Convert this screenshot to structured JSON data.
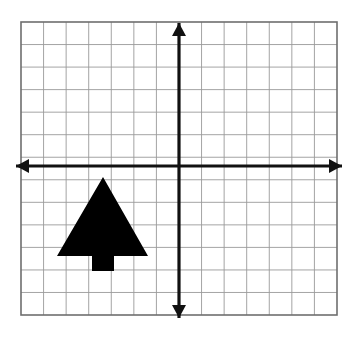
{
  "figure": {
    "background_color": "#ffffff",
    "canvas": {
      "width": 356,
      "height": 339
    }
  },
  "grid": {
    "label": "grid",
    "x_left": 21,
    "y_top": 22,
    "x_right": 337,
    "y_bottom": 315,
    "columns": 14,
    "rows": 13,
    "cell_width": 22.57,
    "cell_height": 22.54,
    "minor_line_color": "#9a9a9a",
    "border_color": "#6e6e6e",
    "minor_line_width": 0.9,
    "border_line_width": 1.6
  },
  "axes": {
    "label": "axes",
    "color": "#111111",
    "line_width": 3.2,
    "origin_x": 179,
    "origin_y": 166,
    "x_axis": {
      "name": "x-axis",
      "y": 166,
      "x_start": 16,
      "x_end": 342,
      "arrow_left": true,
      "arrow_right": true
    },
    "y_axis": {
      "name": "y-axis",
      "x": 179,
      "y_start": 23,
      "y_end": 318,
      "arrow_up": true,
      "arrow_down": true
    },
    "arrowhead": {
      "length": 13,
      "half_width": 7
    }
  },
  "shape": {
    "name": "arrow-figure",
    "description": "Upward-pointing solid black arrow (triangle head on rectangular stem) located in the third quadrant, left of the y-axis and below the x-axis",
    "fill_color": "#000000",
    "points": [
      [
        103,
        177
      ],
      [
        148,
        256
      ],
      [
        114,
        256
      ],
      [
        114,
        271
      ],
      [
        92,
        271
      ],
      [
        92,
        256
      ],
      [
        57,
        256
      ]
    ],
    "grid_points": [
      [
        -3.4,
        -0.5
      ],
      [
        -1.4,
        -4.0
      ],
      [
        -2.9,
        -4.0
      ],
      [
        -2.9,
        -4.7
      ],
      [
        -3.9,
        -4.7
      ],
      [
        -3.9,
        -4.0
      ],
      [
        -5.4,
        -4.0
      ]
    ],
    "apex": [
      103,
      177
    ],
    "base_y": 256,
    "base_left_x": 57,
    "base_right_x": 148,
    "stem_left_x": 92,
    "stem_right_x": 114,
    "stem_bottom_y": 271
  },
  "chart_data": {
    "type": "scatter",
    "title": "",
    "xlabel": "",
    "ylabel": "",
    "grid": true,
    "legend": false,
    "xlim": [
      -7,
      7
    ],
    "ylim": [
      -6.4,
      6.6
    ],
    "x_ticks": [
      -7,
      -6,
      -5,
      -4,
      -3,
      -2,
      -1,
      0,
      1,
      2,
      3,
      4,
      5,
      6,
      7
    ],
    "y_ticks": [
      -6,
      -5,
      -4,
      -3,
      -2,
      -1,
      0,
      1,
      2,
      3,
      4,
      5,
      6
    ],
    "tick_labels_shown": false,
    "series": [
      {
        "name": "arrow-figure",
        "type": "polygon",
        "fill": "#000000",
        "x": [
          -3.4,
          -1.4,
          -2.9,
          -2.9,
          -3.9,
          -3.9,
          -5.4
        ],
        "y": [
          -0.5,
          -4.0,
          -4.0,
          -4.7,
          -4.7,
          -4.0,
          -4.0
        ]
      }
    ]
  }
}
